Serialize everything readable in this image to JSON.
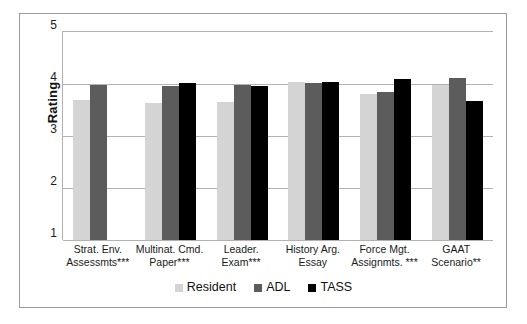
{
  "chart_data": {
    "type": "bar",
    "title": "",
    "xlabel": "",
    "ylabel": "Rating",
    "ylim": [
      1,
      5
    ],
    "yticks": [
      1,
      2,
      3,
      4,
      5
    ],
    "ytick_labels": [
      "1",
      "2",
      "3",
      "4",
      "5"
    ],
    "grid": true,
    "legend_position": "bottom",
    "categories": [
      "Strat. Env. Assessmts***",
      "Multinat. Cmd. Paper***",
      "Leader. Exam***",
      "History Arg. Essay",
      "Force Mgt. Assignmts. ***",
      "GAAT Scenario**"
    ],
    "category_lines": [
      [
        "Strat. Env.",
        "Assessmts***"
      ],
      [
        "Multinat. Cmd.",
        "Paper***"
      ],
      [
        "Leader.",
        "Exam***"
      ],
      [
        "History Arg.",
        "Essay"
      ],
      [
        "Force Mgt.",
        "Assignmts. ***"
      ],
      [
        "GAAT",
        "Scenario**"
      ]
    ],
    "series": [
      {
        "name": "Resident",
        "color": "#d4d4d4",
        "values": [
          3.69,
          3.64,
          3.65,
          4.03,
          3.81,
          3.99
        ]
      },
      {
        "name": "ADL",
        "color": "#5c5c5c",
        "values": [
          3.98,
          3.96,
          3.99,
          4.01,
          3.85,
          4.11
        ]
      },
      {
        "name": "TASS",
        "color": "#000000",
        "values": [
          null,
          4.01,
          3.96,
          4.04,
          4.09,
          3.67
        ]
      }
    ]
  },
  "axis": {
    "y_title": "Rating"
  },
  "legend": {
    "items": [
      {
        "label": "Resident",
        "color": "#d4d4d4"
      },
      {
        "label": "ADL",
        "color": "#5c5c5c"
      },
      {
        "label": "TASS",
        "color": "#000000"
      }
    ]
  },
  "colors": {
    "frame": "#9a9a9a",
    "gridline": "#b2b2b2",
    "background": "#ffffff",
    "text": "#1a1a1a"
  }
}
